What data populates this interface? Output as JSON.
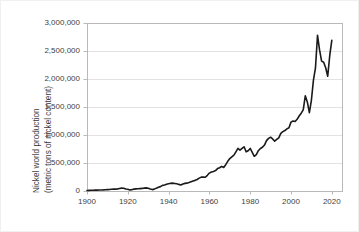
{
  "chart_data": {
    "type": "line",
    "title": "",
    "xlabel": "",
    "ylabel": "Nickel world production (metric tons of nickel content)",
    "ylabel_line1": "Nickel world production",
    "ylabel_line2": "(metric tons of nickel content)",
    "xlim": [
      1900,
      2025
    ],
    "ylim": [
      0,
      3000000
    ],
    "grid": true,
    "legend": false,
    "legend_position": "none",
    "line_color": "#1a1a1a",
    "grid_color": "#e2e2e2",
    "frame_color": "#b9b9b9",
    "background": "#ffffff",
    "x_ticks": [
      1900,
      1920,
      1940,
      1960,
      1980,
      2000,
      2020
    ],
    "x_tick_labels": [
      "1900",
      "1920",
      "1940",
      "1960",
      "1980",
      "2000",
      "2020"
    ],
    "y_ticks": [
      0,
      500000,
      1000000,
      1500000,
      2000000,
      2500000,
      3000000
    ],
    "y_tick_labels": [
      "0",
      "500,000",
      "1,000,000",
      "1,500,000",
      "2,000,000",
      "2,500,000",
      "3,000,000"
    ],
    "x": [
      1900,
      1901,
      1902,
      1903,
      1904,
      1905,
      1906,
      1907,
      1908,
      1909,
      1910,
      1911,
      1912,
      1913,
      1914,
      1915,
      1916,
      1917,
      1918,
      1919,
      1920,
      1921,
      1922,
      1923,
      1924,
      1925,
      1926,
      1927,
      1928,
      1929,
      1930,
      1931,
      1932,
      1933,
      1934,
      1935,
      1936,
      1937,
      1938,
      1939,
      1940,
      1941,
      1942,
      1943,
      1944,
      1945,
      1946,
      1947,
      1948,
      1949,
      1950,
      1951,
      1952,
      1953,
      1954,
      1955,
      1956,
      1957,
      1958,
      1959,
      1960,
      1961,
      1962,
      1963,
      1964,
      1965,
      1966,
      1967,
      1968,
      1969,
      1970,
      1971,
      1972,
      1973,
      1974,
      1975,
      1976,
      1977,
      1978,
      1979,
      1980,
      1981,
      1982,
      1983,
      1984,
      1985,
      1986,
      1987,
      1988,
      1989,
      1990,
      1991,
      1992,
      1993,
      1994,
      1995,
      1996,
      1997,
      1998,
      1999,
      2000,
      2001,
      2002,
      2003,
      2004,
      2005,
      2006,
      2007,
      2008,
      2009,
      2010,
      2011,
      2012,
      2013,
      2014,
      2015,
      2016,
      2017,
      2018,
      2019,
      2020
    ],
    "values": [
      9000,
      11000,
      13000,
      14000,
      15000,
      16000,
      18000,
      19000,
      20000,
      22000,
      24000,
      26000,
      30000,
      33000,
      33000,
      38000,
      46000,
      52000,
      50000,
      35000,
      30000,
      18000,
      24000,
      34000,
      38000,
      40000,
      43000,
      46000,
      51000,
      56000,
      50000,
      35000,
      25000,
      34000,
      51000,
      66000,
      78000,
      100000,
      108000,
      120000,
      130000,
      137000,
      140000,
      135000,
      130000,
      118000,
      108000,
      125000,
      136000,
      140000,
      150000,
      166000,
      180000,
      190000,
      205000,
      230000,
      248000,
      250000,
      245000,
      280000,
      320000,
      340000,
      350000,
      365000,
      400000,
      415000,
      440000,
      420000,
      470000,
      530000,
      580000,
      610000,
      640000,
      700000,
      760000,
      730000,
      760000,
      790000,
      700000,
      720000,
      760000,
      690000,
      620000,
      650000,
      720000,
      760000,
      780000,
      820000,
      900000,
      940000,
      960000,
      930000,
      890000,
      920000,
      950000,
      1030000,
      1060000,
      1080000,
      1110000,
      1130000,
      1230000,
      1250000,
      1240000,
      1280000,
      1340000,
      1390000,
      1450000,
      1700000,
      1590000,
      1400000,
      1620000,
      1980000,
      2200000,
      2780000,
      2520000,
      2320000,
      2300000,
      2200000,
      2050000,
      2420000,
      2690000
    ],
    "line_width": 1.6
  },
  "figure": {
    "plot_left": 86,
    "plot_top": 22,
    "plot_right": 341,
    "plot_bottom": 190
  }
}
